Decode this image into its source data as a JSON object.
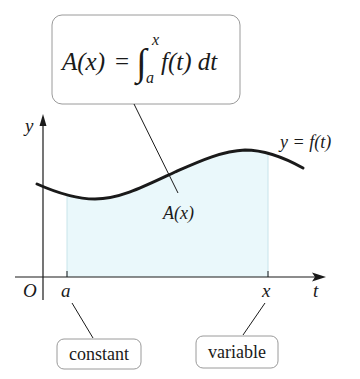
{
  "formula_box": {
    "lhs": "A(x)",
    "equals": "=",
    "integral_sign": "∫",
    "upper_limit": "x",
    "lower_limit": "a",
    "integrand": "f(t) dt"
  },
  "axes": {
    "y_label": "y",
    "x_label": "t",
    "origin_label": "O"
  },
  "curve": {
    "label": "y = f(t)"
  },
  "area": {
    "label": "A(x)",
    "fill_color": "#eaf8fb"
  },
  "ticks": {
    "a_label": "a",
    "x_label": "x"
  },
  "callouts": {
    "constant": "constant",
    "variable": "variable"
  },
  "colors": {
    "stroke": "#1a1a1a",
    "box_border": "#9a9a9a",
    "shade": "#eaf8fb"
  }
}
